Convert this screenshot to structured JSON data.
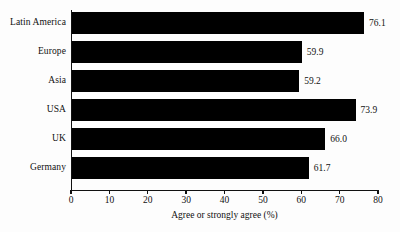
{
  "chart_data": {
    "type": "bar",
    "orientation": "horizontal",
    "title": "",
    "xlabel": "Agree or strongly agree (%)",
    "ylabel": "",
    "categories": [
      "Latin America",
      "Europe",
      "Asia",
      "USA",
      "UK",
      "Germany"
    ],
    "values": [
      76.1,
      59.9,
      59.2,
      73.9,
      66.0,
      61.7
    ],
    "value_labels": [
      "76.1",
      "59.9",
      "59.2",
      "73.9",
      "66.0",
      "61.7"
    ],
    "xlim": [
      0,
      80
    ],
    "xticks": [
      0,
      10,
      20,
      30,
      40,
      50,
      60,
      70,
      80
    ],
    "xticklabels": [
      "0",
      "10",
      "20",
      "30",
      "40",
      "50",
      "60",
      "70",
      "80"
    ],
    "grid": false,
    "legend": false,
    "bar_color": "#000000",
    "background_color": "#fdfdfd",
    "axis_color": "#111111"
  }
}
